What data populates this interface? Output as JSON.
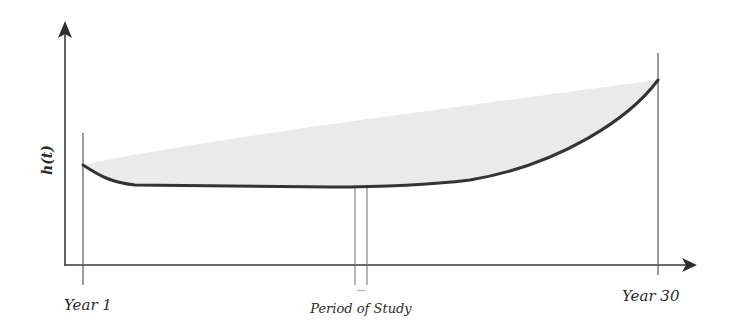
{
  "diagram": {
    "type": "hazard-function-curve",
    "y_axis_label": "h(t)",
    "x_labels": {
      "start": "Year 1",
      "end": "Year 30",
      "study": "Period of Study"
    },
    "colors": {
      "axis": "#3a3a3a",
      "curve": "#333333",
      "shade": "#ececec",
      "guide": "#6a6a6a"
    },
    "curve_shape": "bathtub",
    "shaded_region": "area above hazard curve"
  }
}
